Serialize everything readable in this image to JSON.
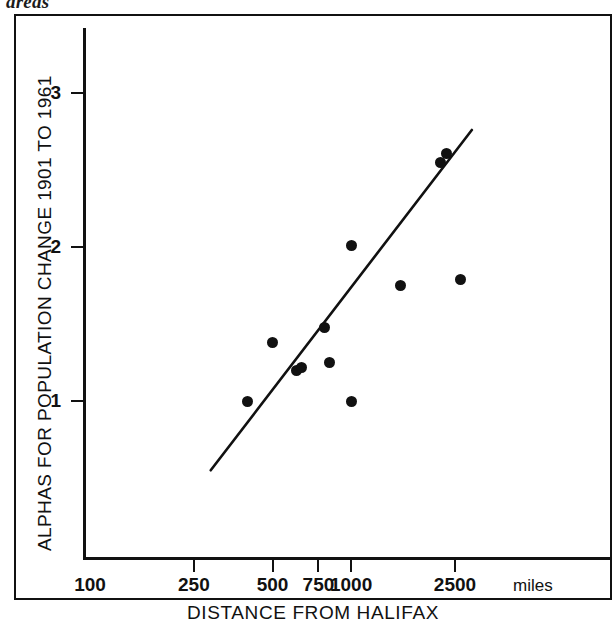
{
  "figure": {
    "top_caption_fragment": "areas",
    "frame": {
      "border_color": "#111111"
    }
  },
  "chart_data": {
    "type": "scatter",
    "title": "",
    "xlabel": "DISTANCE FROM HALIFAX",
    "ylabel": "ALPHAS FOR POPULATION CHANGE 1901 TO 1961",
    "x_unit": "miles",
    "x_scale": "log",
    "y_scale": "linear",
    "xlim": [
      100,
      3200
    ],
    "ylim": [
      0.35,
      3.45
    ],
    "grid": false,
    "legend": null,
    "x_ticks": [
      100,
      250,
      500,
      750,
      1000,
      2500
    ],
    "x_tick_labels": [
      "100",
      "250",
      "500",
      "750",
      "1000",
      "2500"
    ],
    "y_ticks": [
      1,
      2,
      3
    ],
    "y_tick_labels": [
      "1",
      "2",
      "3"
    ],
    "points": [
      {
        "x": 400,
        "y": 1.0
      },
      {
        "x": 500,
        "y": 1.38
      },
      {
        "x": 620,
        "y": 1.2
      },
      {
        "x": 645,
        "y": 1.22
      },
      {
        "x": 790,
        "y": 1.48
      },
      {
        "x": 830,
        "y": 1.25
      },
      {
        "x": 1000,
        "y": 1.0
      },
      {
        "x": 1000,
        "y": 2.01
      },
      {
        "x": 1550,
        "y": 1.75
      },
      {
        "x": 2200,
        "y": 2.55
      },
      {
        "x": 2320,
        "y": 2.61
      },
      {
        "x": 2620,
        "y": 1.79
      }
    ],
    "trend_line": {
      "type": "linear-fit",
      "x_start": 290,
      "y_start": 0.55,
      "x_end": 2900,
      "y_end": 2.76,
      "color": "#111111"
    },
    "marker": {
      "shape": "circle",
      "color": "#111111",
      "size": 11
    }
  }
}
